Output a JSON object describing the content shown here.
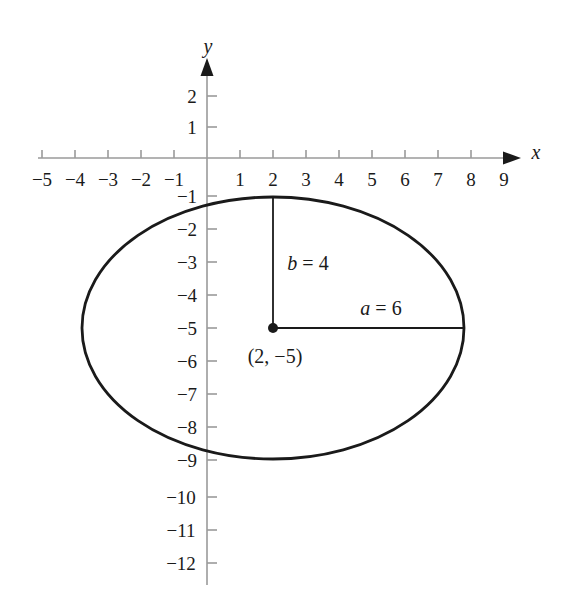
{
  "chart_data": {
    "type": "scatter",
    "title": "",
    "xlabel": "x",
    "ylabel": "y",
    "grid": false,
    "legend": null,
    "xlim": [
      -5.8,
      9.8
    ],
    "ylim": [
      -12.6,
      2.8
    ],
    "x_ticks": [
      -5,
      -4,
      -3,
      -2,
      -1,
      1,
      2,
      3,
      4,
      5,
      6,
      7,
      8,
      9
    ],
    "y_ticks": [
      2,
      1,
      -1,
      -2,
      -3,
      -4,
      -5,
      -6,
      -7,
      -8,
      -9,
      -10,
      -11,
      -12
    ],
    "x_tick_labels": [
      "−5",
      "−4",
      "−3",
      "−2",
      "−1",
      "1",
      "2",
      "3",
      "4",
      "5",
      "6",
      "7",
      "8",
      "9"
    ],
    "y_tick_labels": [
      "2",
      "1",
      "−1",
      "−2",
      "−3",
      "−4",
      "−5",
      "−6",
      "−7",
      "−8",
      "−9",
      "−10",
      "−11",
      "−12"
    ],
    "shapes": [
      {
        "kind": "ellipse",
        "center": [
          2,
          -5
        ],
        "semi_major_a": 6,
        "semi_minor_b": 4,
        "orientation": "horizontal",
        "stroke": "#1a1a1a",
        "fill": "none",
        "stroke_width": 2.6,
        "x_extent": [
          -4,
          8
        ],
        "y_extent": [
          -9,
          -1
        ]
      }
    ],
    "points": [
      {
        "label": "center",
        "coords": [
          2,
          -5
        ],
        "display": "(2, −5)",
        "marker": "filled-circle"
      }
    ],
    "segments": [
      {
        "name": "semi-minor-axis",
        "from": [
          2,
          -5
        ],
        "to": [
          2,
          -1
        ],
        "label": "b = 4",
        "length": 4
      },
      {
        "name": "semi-major-axis",
        "from": [
          2,
          -5
        ],
        "to": [
          8,
          -5
        ],
        "label": "a = 6",
        "length": 6
      }
    ],
    "annotations": [
      {
        "id": "b-label",
        "var": "b",
        "eq": "=",
        "value": "4",
        "text": "b = 4",
        "at": [
          2.55,
          -3.0
        ]
      },
      {
        "id": "a-label",
        "var": "a",
        "eq": "=",
        "value": "6",
        "text": "a = 6",
        "at": [
          5.0,
          -4.35
        ]
      },
      {
        "id": "center-point-label",
        "text": "(2, −5)",
        "at": [
          2.0,
          -5.75
        ]
      }
    ]
  },
  "axes": {
    "x_axis_label": "x",
    "y_axis_label": "y",
    "axis_color": "#9a9a9a",
    "tick_color": "#9a9a9a",
    "label_color": "#1a1a1a",
    "arrow_color": "#1a1a1a"
  },
  "colors": {
    "background": "#ffffff",
    "curve": "#1a1a1a",
    "text": "#1a1a1a",
    "axis": "#9a9a9a"
  }
}
